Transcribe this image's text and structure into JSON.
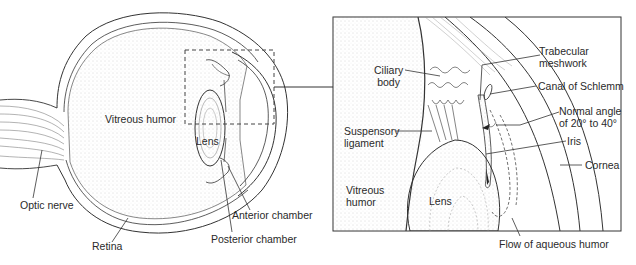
{
  "figure": {
    "colors": {
      "line": "#333333",
      "stipple": "#bbbbbb",
      "background": "#ffffff"
    }
  },
  "left_panel": {
    "labels": {
      "vitreous_humor": "Vitreous humor",
      "lens": "Lens",
      "optic_nerve": "Optic nerve",
      "retina": "Retina",
      "anterior_chamber": "Anterior chamber",
      "posterior_chamber": "Posterior chamber"
    }
  },
  "right_panel": {
    "labels": {
      "ciliary_body_1": "Ciliary",
      "ciliary_body_2": "body",
      "trabecular_1": "Trabecular",
      "trabecular_2": "meshwork",
      "canal_of_schlemm": "Canal of Schlemm",
      "normal_angle_1": "Normal angle",
      "normal_angle_2": "of 20° to 40°",
      "suspensory_1": "Suspensory",
      "suspensory_2": "ligament",
      "iris": "Iris",
      "cornea": "Cornea",
      "vitreous_1": "Vitreous",
      "vitreous_2": "humor",
      "lens": "Lens",
      "flow": "Flow of aqueous humor"
    }
  }
}
